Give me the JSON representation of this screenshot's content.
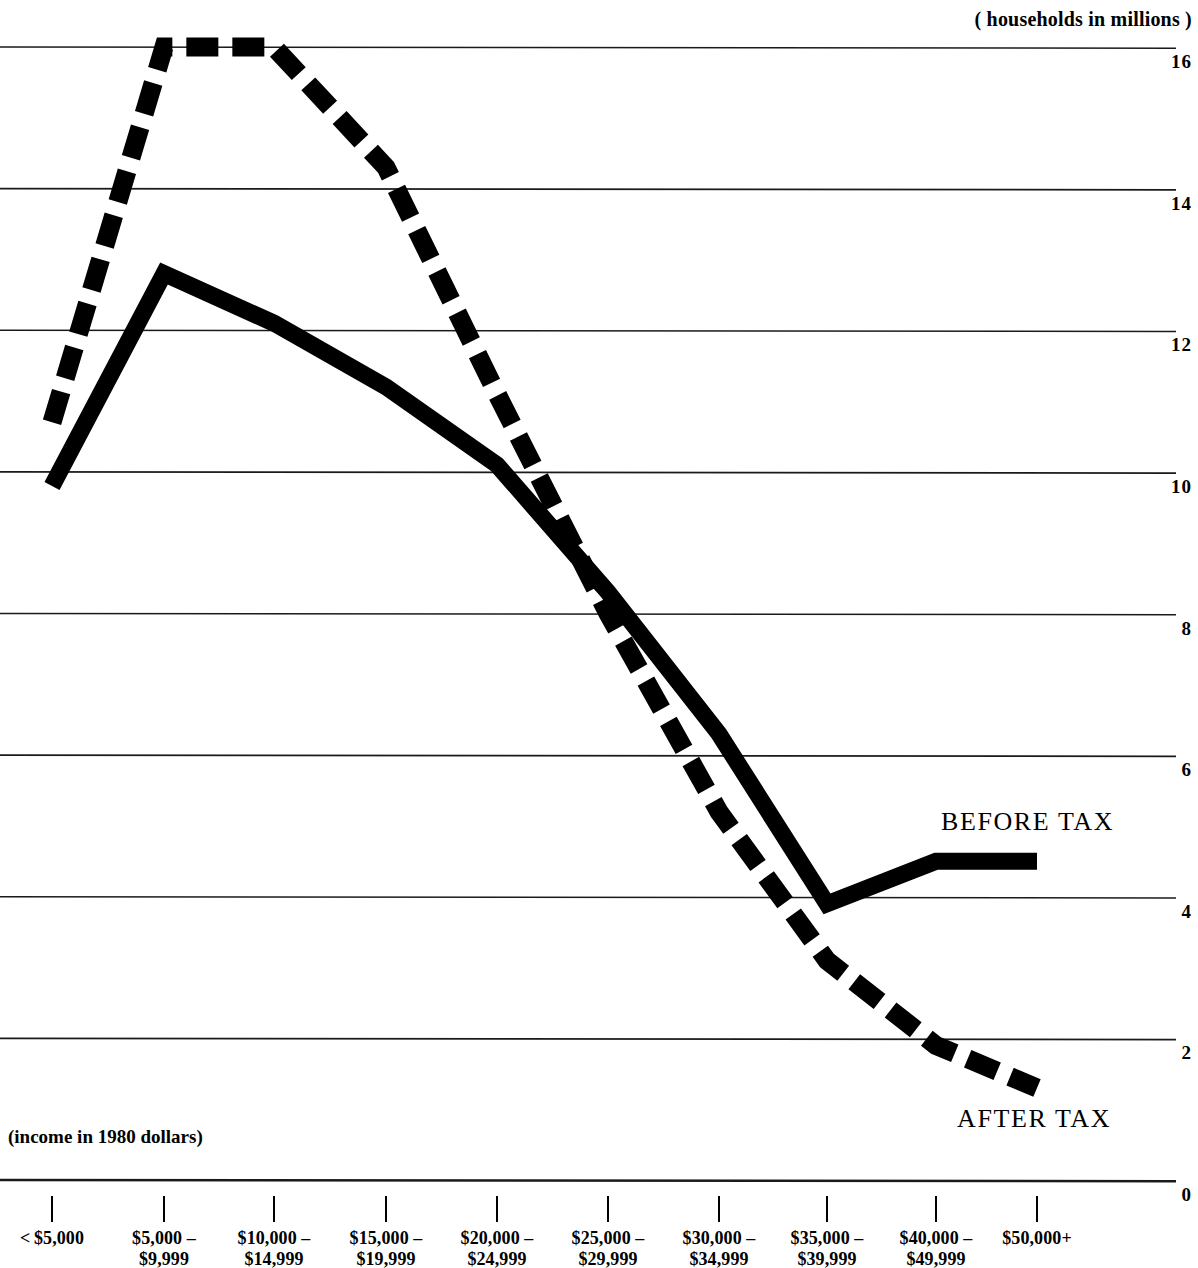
{
  "captions": {
    "y_axis_note": "( households in millions )",
    "x_axis_note": "(income in 1980 dollars)"
  },
  "series_labels": {
    "before_tax": "BEFORE TAX",
    "after_tax": "AFTER TAX"
  },
  "y_ticks": [
    "16",
    "14",
    "12",
    "10",
    "8",
    "6",
    "4",
    "2",
    "0"
  ],
  "x_categories": [
    {
      "line1": "< $5,000",
      "line2": ""
    },
    {
      "line1": "$5,000 –",
      "line2": "$9,999"
    },
    {
      "line1": "$10,000 –",
      "line2": "$14,999"
    },
    {
      "line1": "$15,000 –",
      "line2": "$19,999"
    },
    {
      "line1": "$20,000 –",
      "line2": "$24,999"
    },
    {
      "line1": "$25,000 –",
      "line2": "$29,999"
    },
    {
      "line1": "$30,000 –",
      "line2": "$34,999"
    },
    {
      "line1": "$35,000 –",
      "line2": "$39,999"
    },
    {
      "line1": "$40,000 –",
      "line2": "$49,999"
    },
    {
      "line1": "$50,000+",
      "line2": ""
    }
  ],
  "colors": {
    "ink": "#000000",
    "gridline": "#1a1a1a",
    "background": "#ffffff"
  },
  "chart_data": {
    "type": "line",
    "title": "",
    "subtitle": "",
    "xlabel": "(income in 1980 dollars)",
    "ylabel": "( households in millions )",
    "ylim": [
      0,
      16
    ],
    "yticks": [
      0,
      2,
      4,
      6,
      8,
      10,
      12,
      14,
      16
    ],
    "grid": true,
    "legend": "inline annotations at line ends",
    "categories": [
      "<$5,000",
      "$5,000-$9,999",
      "$10,000-$14,999",
      "$15,000-$19,999",
      "$20,000-$24,999",
      "$25,000-$29,999",
      "$30,000-$34,999",
      "$35,000-$39,999",
      "$40,000-$49,999",
      "$50,000+"
    ],
    "series": [
      {
        "name": "BEFORE TAX",
        "style": "solid",
        "values": [
          9.8,
          12.8,
          12.1,
          11.2,
          10.1,
          8.3,
          6.3,
          3.9,
          4.5,
          4.5
        ]
      },
      {
        "name": "AFTER TAX",
        "style": "dashed",
        "values": [
          10.7,
          16.0,
          16.0,
          14.3,
          11.1,
          8.0,
          5.2,
          3.1,
          1.9,
          1.3
        ]
      }
    ]
  },
  "geometry": {
    "x_positions": [
      52,
      164,
      274,
      386,
      497,
      608,
      719,
      827,
      936,
      1037
    ],
    "y_for_16": 47,
    "y_for_0": 1180,
    "gridline_left": 0,
    "gridline_right": 1176,
    "line_width_solid": 17,
    "line_width_dashed": 19,
    "dash_pattern": "32 14"
  }
}
